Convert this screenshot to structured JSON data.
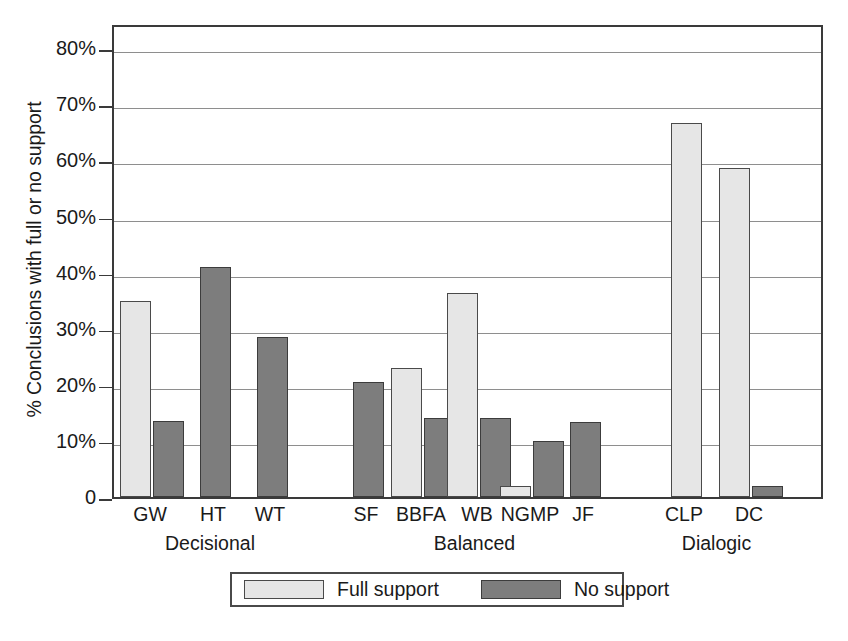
{
  "chart_data": {
    "type": "bar",
    "title": "",
    "xlabel": "",
    "ylabel": "% Conclusions with full or no support",
    "ylim": [
      0,
      84.5
    ],
    "grid": true,
    "legend_position": "bottom",
    "ytick_labels": [
      "0",
      "10%",
      "20%",
      "30%",
      "40%",
      "50%",
      "60%",
      "70%",
      "80%"
    ],
    "ytick_values": [
      0,
      10,
      20,
      30,
      40,
      50,
      60,
      70,
      80
    ],
    "categories": [
      "GW",
      "HT",
      "WT",
      "SF",
      "BBFA",
      "WB",
      "NGMP",
      "JF",
      "CLP",
      "DC"
    ],
    "groups": [
      {
        "label": "Decisional",
        "categories": [
          "GW",
          "HT",
          "WT"
        ]
      },
      {
        "label": "Balanced",
        "categories": [
          "SF",
          "BBFA",
          "WB",
          "NGMP",
          "JF"
        ]
      },
      {
        "label": "Dialogic",
        "categories": [
          "CLP",
          "DC"
        ]
      }
    ],
    "series": [
      {
        "name": "Full support",
        "color": "#e6e6e6",
        "values": [
          34.9,
          0,
          0,
          0,
          23.0,
          36.3,
          2.0,
          0,
          66.7,
          58.7
        ]
      },
      {
        "name": "No support",
        "color": "#7d7d7d",
        "values": [
          13.5,
          41.0,
          28.5,
          20.5,
          14.0,
          14.0,
          9.9,
          13.4,
          0,
          1.9
        ]
      }
    ]
  },
  "legend": {
    "entries": [
      {
        "label": "Full support",
        "swatch": "full"
      },
      {
        "label": "No support",
        "swatch": "no"
      }
    ]
  },
  "caption": {
    "text": ""
  }
}
